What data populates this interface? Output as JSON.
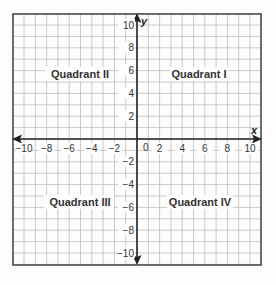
{
  "chart_data": {
    "type": "coordinate-plane",
    "title": "",
    "xlabel": "x",
    "ylabel": "y",
    "xlim": [
      -11,
      11
    ],
    "ylim": [
      -11,
      11
    ],
    "grid": true,
    "x_ticks": [
      -10,
      -8,
      -6,
      -4,
      -2,
      0,
      2,
      4,
      6,
      8,
      10
    ],
    "y_ticks": [
      10,
      8,
      6,
      4,
      2,
      -2,
      -4,
      -6,
      -8,
      -10
    ],
    "x_tick_labels": [
      "−10",
      "−8",
      "−6",
      "−4",
      "−2",
      "0",
      "2",
      "4",
      "6",
      "8",
      "10"
    ],
    "y_tick_labels": [
      "10",
      "8",
      "6",
      "4",
      "2",
      "−2",
      "−4",
      "−6",
      "−8",
      "−10"
    ],
    "annotations": [
      {
        "text": "Quadrant II",
        "x": -5,
        "y": 5
      },
      {
        "text": "Quadrant I",
        "x": 5,
        "y": 5
      },
      {
        "text": "Quadrant III",
        "x": -5,
        "y": -5
      },
      {
        "text": "Quadrant IV",
        "x": 5,
        "y": -5
      }
    ]
  },
  "labels": {
    "x_axis": "x",
    "y_axis": "y",
    "origin": "0",
    "q1": "Quadrant I",
    "q2": "Quadrant II",
    "q3": "Quadrant III",
    "q4": "Quadrant IV"
  },
  "colors": {
    "grid": "#bdbdbd",
    "axis": "#222222",
    "border": "#444444",
    "text": "#333333"
  }
}
